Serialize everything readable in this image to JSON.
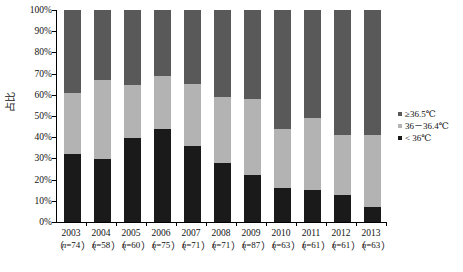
{
  "chart_data": {
    "type": "bar",
    "subtype": "stacked-bar-100-percent",
    "title": "",
    "xlabel": "",
    "ylabel": "占比",
    "ylim": [
      0,
      100
    ],
    "yunit": "%",
    "grid": false,
    "legend_position": "right",
    "categories": [
      "2003",
      "2004",
      "2005",
      "2006",
      "2007",
      "2008",
      "2009",
      "2010",
      "2011",
      "2012",
      "2013"
    ],
    "sample_sizes": [
      "n=74",
      "n=58",
      "n=60",
      "n=75",
      "n=71",
      "n=71",
      "n=87",
      "n=63",
      "n=61",
      "n=61",
      "n=63"
    ],
    "ytick_labels": [
      "0%",
      "10%",
      "20%",
      "30%",
      "40%",
      "50%",
      "60%",
      "70%",
      "80%",
      "90%",
      "100%"
    ],
    "ytick_values": [
      0,
      10,
      20,
      30,
      40,
      50,
      60,
      70,
      80,
      90,
      100
    ],
    "series": [
      {
        "name": "< 36℃",
        "color": "#1a1a1a",
        "values": [
          32,
          29.5,
          39.5,
          44,
          36,
          28,
          22,
          16,
          15,
          12.5,
          7
        ]
      },
      {
        "name": "36–36.4℃",
        "color": "#b3b3b3",
        "values": [
          29,
          37.5,
          25,
          25,
          29,
          31,
          36,
          28,
          34,
          28.5,
          34
        ]
      },
      {
        "name": "≥36.5℃",
        "color": "#595959",
        "values": [
          39,
          33,
          35.5,
          31,
          35,
          41,
          42,
          56,
          51,
          59,
          59
        ]
      }
    ]
  },
  "legend": {
    "items": [
      {
        "label": "≥36.5℃",
        "color": "#595959"
      },
      {
        "label": "36－36.4℃",
        "color": "#b3b3b3"
      },
      {
        "label": "< 36℃",
        "color": "#1a1a1a"
      }
    ]
  },
  "axis": {
    "y_title": "占比"
  },
  "paren": {
    "open": "（",
    "close": "）",
    "separator": "）（"
  }
}
